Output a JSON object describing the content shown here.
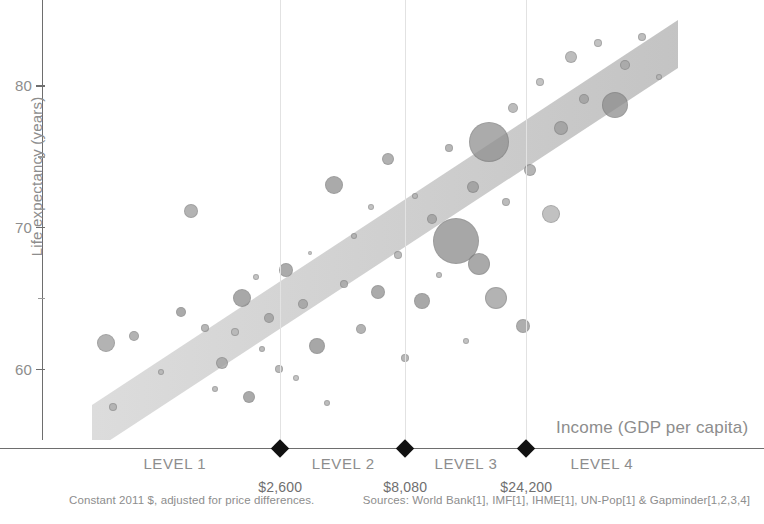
{
  "chart_data": {
    "type": "scatter",
    "title": "",
    "xlabel": "Income (GDP per capita)",
    "ylabel": "Life expectancy (years)",
    "xscale": "log",
    "xlim": [
      300,
      140000
    ],
    "ylim": [
      55,
      86
    ],
    "grid": false,
    "legend_position": "none",
    "yticks": [
      {
        "value": 80,
        "label": "80",
        "major": true
      },
      {
        "value": 75,
        "label": "",
        "major": false
      },
      {
        "value": 70,
        "label": "70",
        "major": true
      },
      {
        "value": 65,
        "label": "",
        "major": false
      },
      {
        "value": 60,
        "label": "60",
        "major": true
      }
    ],
    "income_levels": [
      {
        "label": "LEVEL 1",
        "center_income": 1000
      },
      {
        "label": "LEVEL 2",
        "center_income": 4600
      },
      {
        "label": "LEVEL 3",
        "center_income": 14000
      },
      {
        "label": "LEVEL 4",
        "center_income": 48000
      }
    ],
    "level_boundaries": [
      {
        "value": 2600,
        "label": "$2,600"
      },
      {
        "value": 8080,
        "label": "$8,080"
      },
      {
        "value": 24200,
        "label": "$24,200"
      }
    ],
    "trend_band": {
      "description": "shaded diagonal band showing positive correlation between income and life expectancy",
      "color": "#c9c9c9",
      "opacity": 0.55
    },
    "bubble_encoding": {
      "size": "population",
      "color": "world region",
      "fill_opacity": 0.75
    },
    "points": [
      {
        "x": 9.5,
        "y": 61.8,
        "r": 9,
        "c": "#9a9a9a"
      },
      {
        "x": 10.5,
        "y": 57.3,
        "r": 4,
        "c": "#a8a8a8"
      },
      {
        "x": 13.5,
        "y": 62.3,
        "r": 5,
        "c": "#9a9a9a"
      },
      {
        "x": 17.5,
        "y": 59.8,
        "r": 3,
        "c": "#b0b0b0"
      },
      {
        "x": 20.5,
        "y": 64.0,
        "r": 5,
        "c": "#8e8e8e"
      },
      {
        "x": 22.0,
        "y": 71.1,
        "r": 7,
        "c": "#9a9a9a"
      },
      {
        "x": 24.0,
        "y": 62.9,
        "r": 4,
        "c": "#a0a0a0"
      },
      {
        "x": 25.5,
        "y": 58.6,
        "r": 3,
        "c": "#aaaaaa"
      },
      {
        "x": 26.5,
        "y": 60.4,
        "r": 6,
        "c": "#9d9d9d"
      },
      {
        "x": 28.5,
        "y": 62.6,
        "r": 4,
        "c": "#b0b0b0"
      },
      {
        "x": 29.5,
        "y": 65.0,
        "r": 9,
        "c": "#8b8b8b"
      },
      {
        "x": 30.5,
        "y": 58.0,
        "r": 6,
        "c": "#8e8e8e"
      },
      {
        "x": 31.5,
        "y": 66.5,
        "r": 3,
        "c": "#b2b2b2"
      },
      {
        "x": 32.5,
        "y": 61.4,
        "r": 3,
        "c": "#a6a6a6"
      },
      {
        "x": 33.5,
        "y": 63.6,
        "r": 5,
        "c": "#9a9a9a"
      },
      {
        "x": 35.0,
        "y": 60.0,
        "r": 4,
        "c": "#a4a4a4"
      },
      {
        "x": 36.0,
        "y": 67.0,
        "r": 7,
        "c": "#909090"
      },
      {
        "x": 37.5,
        "y": 59.4,
        "r": 3,
        "c": "#b2b2b2"
      },
      {
        "x": 38.5,
        "y": 64.6,
        "r": 5,
        "c": "#9c9c9c"
      },
      {
        "x": 39.5,
        "y": 68.2,
        "r": 2,
        "c": "#b6b6b6"
      },
      {
        "x": 40.5,
        "y": 61.6,
        "r": 8,
        "c": "#8a8a8a"
      },
      {
        "x": 42.0,
        "y": 57.6,
        "r": 3,
        "c": "#a8a8a8"
      },
      {
        "x": 43.0,
        "y": 73.0,
        "r": 9,
        "c": "#8e8e8e"
      },
      {
        "x": 44.5,
        "y": 66.0,
        "r": 4,
        "c": "#a2a2a2"
      },
      {
        "x": 46.0,
        "y": 69.4,
        "r": 3,
        "c": "#acacac"
      },
      {
        "x": 47.0,
        "y": 62.8,
        "r": 5,
        "c": "#9a9a9a"
      },
      {
        "x": 48.5,
        "y": 71.4,
        "r": 3,
        "c": "#b0b0b0"
      },
      {
        "x": 49.5,
        "y": 65.4,
        "r": 7,
        "c": "#8f8f8f"
      },
      {
        "x": 51.0,
        "y": 74.8,
        "r": 6,
        "c": "#979797"
      },
      {
        "x": 52.5,
        "y": 68.0,
        "r": 4,
        "c": "#a5a5a5"
      },
      {
        "x": 53.5,
        "y": 60.8,
        "r": 4,
        "c": "#a0a0a0"
      },
      {
        "x": 55.0,
        "y": 72.2,
        "r": 3,
        "c": "#b0b0b0"
      },
      {
        "x": 56.0,
        "y": 64.8,
        "r": 8,
        "c": "#8c8c8c"
      },
      {
        "x": 57.5,
        "y": 70.6,
        "r": 5,
        "c": "#9a9a9a"
      },
      {
        "x": 58.5,
        "y": 66.6,
        "r": 3,
        "c": "#aeaeae"
      },
      {
        "x": 60.0,
        "y": 75.6,
        "r": 4,
        "c": "#a0a0a0"
      },
      {
        "x": 61.0,
        "y": 69.0,
        "r": 23,
        "c": "#8a8a8a"
      },
      {
        "x": 62.5,
        "y": 62.0,
        "r": 3,
        "c": "#b0b0b0"
      },
      {
        "x": 63.5,
        "y": 72.8,
        "r": 6,
        "c": "#979797"
      },
      {
        "x": 64.5,
        "y": 67.4,
        "r": 11,
        "c": "#8d8d8d"
      },
      {
        "x": 66.0,
        "y": 76.0,
        "r": 20,
        "c": "#8f8f8f"
      },
      {
        "x": 67.0,
        "y": 65.0,
        "r": 11,
        "c": "#9a9a9a"
      },
      {
        "x": 68.5,
        "y": 71.8,
        "r": 4,
        "c": "#a5a5a5"
      },
      {
        "x": 69.5,
        "y": 78.4,
        "r": 5,
        "c": "#a6a6a6"
      },
      {
        "x": 71.0,
        "y": 63.0,
        "r": 7,
        "c": "#949494"
      },
      {
        "x": 72.0,
        "y": 74.0,
        "r": 6,
        "c": "#9c9c9c"
      },
      {
        "x": 73.5,
        "y": 80.2,
        "r": 4,
        "c": "#b0b0b0"
      },
      {
        "x": 75.0,
        "y": 70.9,
        "r": 9,
        "c": "#adadad"
      },
      {
        "x": 76.5,
        "y": 77.0,
        "r": 7,
        "c": "#9a9a9a"
      },
      {
        "x": 78.0,
        "y": 82.0,
        "r": 6,
        "c": "#a8a8a8"
      },
      {
        "x": 80.0,
        "y": 79.0,
        "r": 5,
        "c": "#9c9c9c"
      },
      {
        "x": 82.0,
        "y": 83.0,
        "r": 4,
        "c": "#aeaeae"
      },
      {
        "x": 84.5,
        "y": 78.6,
        "r": 13,
        "c": "#8d8d8d"
      },
      {
        "x": 86.0,
        "y": 81.4,
        "r": 5,
        "c": "#a2a2a2"
      },
      {
        "x": 88.5,
        "y": 83.4,
        "r": 4,
        "c": "#a9a9a9"
      },
      {
        "x": 91.0,
        "y": 80.6,
        "r": 3,
        "c": "#b0b0b0"
      }
    ]
  },
  "axis": {
    "y_title": "Life expectancy (years)",
    "x_title": "Income (GDP per capita)"
  },
  "footnotes": {
    "left": "Constant 2011 $, adjusted for price differences.",
    "right": "Sources: World Bank[1], IMF[1], IHME[1], UN-Pop[1] & Gapminder[1,2,3,4]"
  },
  "colors": {
    "axis": "#6e6e6e",
    "text": "#8d8d8d",
    "divider": "#e2e2e2",
    "marker": "#111111",
    "band": "#c9c9c9"
  }
}
